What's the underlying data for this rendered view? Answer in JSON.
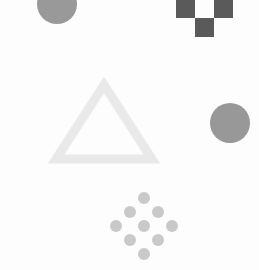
{
  "canvas": {
    "width": 259,
    "height": 270,
    "background_color": "#fdfdfd",
    "title": "Abstract Geometric Shapes"
  },
  "palette": {
    "background": "#fdfdfd",
    "dark_gray": "#5a5a5a",
    "medium_gray": "#989898",
    "light_gray": "#c9c9c9",
    "very_light_gray": "#e9e9e9"
  },
  "shapes": {
    "top_left_circle": {
      "name": "top-left-circle",
      "type": "circle",
      "cx": 57,
      "cy": 4,
      "r": 20,
      "fill": "#999999",
      "clipped_edge": "top"
    },
    "checkerboard": {
      "name": "checkerboard-pattern",
      "type": "grid",
      "origin_x": 176,
      "origin_y": -1,
      "cell_size": 19,
      "columns": 3,
      "rows": 2,
      "fill": "#5a5a5a",
      "filled_cells": [
        {
          "col": 0,
          "row": 0
        },
        {
          "col": 2,
          "row": 0
        },
        {
          "col": 1,
          "row": 1
        }
      ]
    },
    "triangle": {
      "name": "hollow-triangle",
      "type": "triangle-outline",
      "apex_x": 104,
      "apex_y": 85,
      "base_left_x": 56,
      "base_right_x": 152,
      "base_y": 159,
      "stroke": "#e9e9e9",
      "stroke_width": 9,
      "fill": "none"
    },
    "right_circle": {
      "name": "right-circle",
      "type": "circle",
      "cx": 230,
      "cy": 123,
      "r": 20,
      "fill": "#989898"
    },
    "dot_diamond": {
      "name": "dot-diamond-lattice",
      "type": "dot-lattice",
      "fill": "#c9c9c9",
      "dot_radius": 6,
      "dots": [
        {
          "cx": 144,
          "cy": 198
        },
        {
          "cx": 130,
          "cy": 212
        },
        {
          "cx": 158,
          "cy": 212
        },
        {
          "cx": 116,
          "cy": 226
        },
        {
          "cx": 144,
          "cy": 226
        },
        {
          "cx": 172,
          "cy": 226
        },
        {
          "cx": 130,
          "cy": 240
        },
        {
          "cx": 158,
          "cy": 240
        },
        {
          "cx": 144,
          "cy": 254
        }
      ]
    }
  },
  "chart_data": {
    "type": "scatter",
    "xlabel": "",
    "ylabel": "",
    "xlim": [
      0,
      259
    ],
    "ylim": [
      0,
      270
    ],
    "grid": false,
    "legend": "none",
    "series": [
      {
        "name": "top-left-circle",
        "shape": "circle",
        "color": "#999999",
        "points": [
          {
            "x": 57,
            "y": 4,
            "size": 20
          }
        ]
      },
      {
        "name": "checkerboard-pattern",
        "shape": "square",
        "color": "#5a5a5a",
        "points": [
          {
            "x": 185,
            "y": 8,
            "size": 19
          },
          {
            "x": 223,
            "y": 8,
            "size": 19
          },
          {
            "x": 204,
            "y": 27,
            "size": 19
          }
        ]
      },
      {
        "name": "hollow-triangle",
        "shape": "triangle",
        "color": "#e9e9e9",
        "points": [
          {
            "x": 104,
            "y": 122,
            "size": 48
          }
        ]
      },
      {
        "name": "right-circle",
        "shape": "circle",
        "color": "#989898",
        "points": [
          {
            "x": 230,
            "y": 123,
            "size": 20
          }
        ]
      },
      {
        "name": "dot-diamond-lattice",
        "shape": "circle",
        "color": "#c9c9c9",
        "points": [
          {
            "x": 144,
            "y": 198,
            "size": 6
          },
          {
            "x": 130,
            "y": 212,
            "size": 6
          },
          {
            "x": 158,
            "y": 212,
            "size": 6
          },
          {
            "x": 116,
            "y": 226,
            "size": 6
          },
          {
            "x": 144,
            "y": 226,
            "size": 6
          },
          {
            "x": 172,
            "y": 226,
            "size": 6
          },
          {
            "x": 130,
            "y": 240,
            "size": 6
          },
          {
            "x": 158,
            "y": 240,
            "size": 6
          },
          {
            "x": 144,
            "y": 254,
            "size": 6
          }
        ]
      }
    ]
  }
}
